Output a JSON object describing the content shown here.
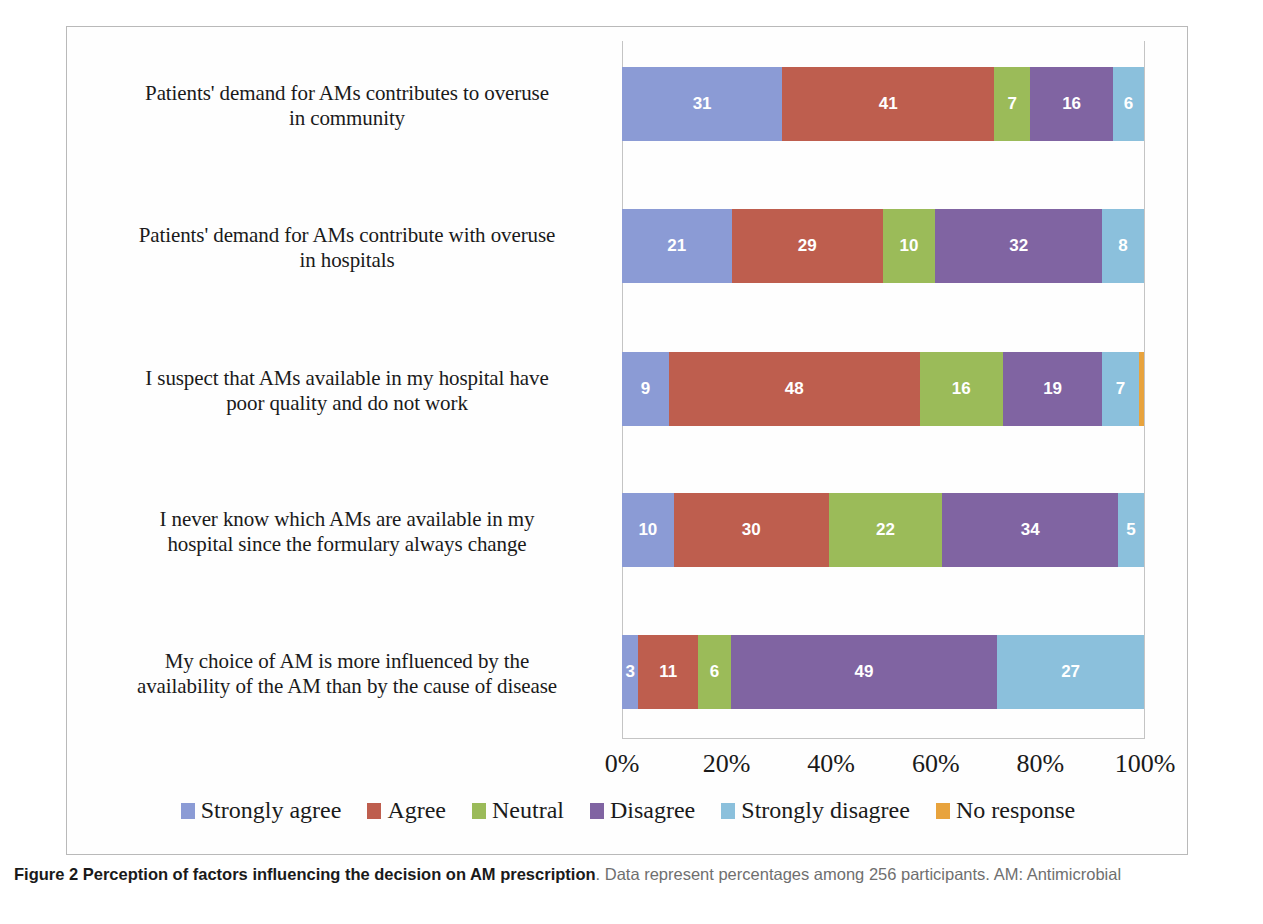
{
  "caption": {
    "title": "Figure 2 Perception of factors influencing the decision on AM prescription",
    "body": ". Data represent percentages among 256 participants. AM: Antimicrobial"
  },
  "chart_data": {
    "type": "bar",
    "orientation": "horizontal",
    "stacked": true,
    "normalized": "percent",
    "title": "Perception of factors influencing the decision on AM prescription",
    "xlabel": "",
    "ylabel": "",
    "xlim": [
      0,
      100
    ],
    "xticks": [
      "0%",
      "20%",
      "40%",
      "60%",
      "80%",
      "100%"
    ],
    "xtick_values": [
      0,
      20,
      40,
      60,
      80,
      100
    ],
    "grid": false,
    "legend_position": "bottom",
    "categories": [
      "Patients' demand for AMs contributes to overuse in community",
      "Patients' demand for AMs contribute with overuse in hospitals",
      "I suspect that AMs available in my hospital have poor quality and do not work",
      "I never know which AMs are available in my hospital since the formulary always change",
      "My choice of AM is more influenced by the availability of the AM than by the cause of disease"
    ],
    "category_lines": [
      [
        "Patients' demand for AMs contributes to overuse",
        "in community"
      ],
      [
        "Patients' demand for AMs contribute with overuse",
        "in hospitals"
      ],
      [
        "I suspect that AMs available in my hospital have",
        "poor quality and do not work"
      ],
      [
        "I never know which AMs are available in my",
        "hospital since the formulary always change"
      ],
      [
        "My choice of AM is more influenced by the",
        "availability of the AM than by the cause of disease"
      ]
    ],
    "series": [
      {
        "name": "Strongly agree",
        "color": "#8b9bd5",
        "values": [
          31,
          21,
          9,
          10,
          3
        ]
      },
      {
        "name": "Agree",
        "color": "#be5e4e",
        "values": [
          41,
          29,
          48,
          30,
          11
        ]
      },
      {
        "name": "Neutral",
        "color": "#9bbb59",
        "values": [
          7,
          10,
          16,
          22,
          6
        ]
      },
      {
        "name": "Disagree",
        "color": "#8064a2",
        "values": [
          16,
          32,
          19,
          34,
          49
        ]
      },
      {
        "name": "Strongly disagree",
        "color": "#8bc0dc",
        "values": [
          6,
          8,
          7,
          5,
          27
        ]
      },
      {
        "name": "No response",
        "color": "#e8a33d",
        "values": [
          0,
          0,
          1,
          0,
          0
        ]
      }
    ],
    "bar_labels": [
      [
        "31",
        "41",
        "7",
        "16",
        "6",
        ""
      ],
      [
        "21",
        "29",
        "10",
        "32",
        "8",
        ""
      ],
      [
        "9",
        "48",
        "16",
        "19",
        "7",
        ""
      ],
      [
        "10",
        "30",
        "22",
        "34",
        "5",
        ""
      ],
      [
        "3",
        "11",
        "6",
        "49",
        "27",
        ""
      ]
    ]
  }
}
